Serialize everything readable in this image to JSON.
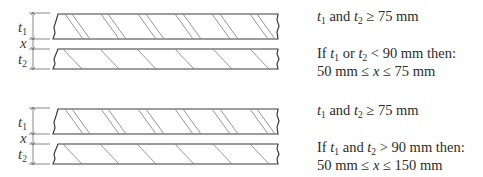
{
  "colors": {
    "outline": "#3a3a3a",
    "hatch": "#8a8a8a",
    "dimension": "#6a6a6a",
    "text": "#2b2b2b",
    "background": "#ffffff"
  },
  "labels": {
    "t": "t",
    "sub1": "1",
    "sub2": "2",
    "x": "x"
  },
  "cases": [
    {
      "id": "case-1",
      "line1": {
        "t1": "t",
        "s1": "1",
        "mid": " and ",
        "t2": "t",
        "s2": "2",
        "rest": " ≥ 75 mm"
      },
      "line2": {
        "pre": "If ",
        "t1": "t",
        "s1": "1",
        "mid": " or ",
        "t2": "t",
        "s2": "2",
        "rest": " < 90 mm then:"
      },
      "line3": {
        "pre": "50 mm ≤ ",
        "x": "x",
        "rest": " ≤ 75 mm"
      }
    },
    {
      "id": "case-2",
      "line1": {
        "t1": "t",
        "s1": "1",
        "mid": " and ",
        "t2": "t",
        "s2": "2",
        "rest": " ≥ 75 mm"
      },
      "line2": {
        "pre": "If ",
        "t1": "t",
        "s1": "1",
        "mid": " and ",
        "t2": "t",
        "s2": "2",
        "rest": " > 90 mm then:"
      },
      "line3": {
        "pre": "50 mm ≤ ",
        "x": "x",
        "rest": " ≤ 150 mm"
      }
    }
  ]
}
